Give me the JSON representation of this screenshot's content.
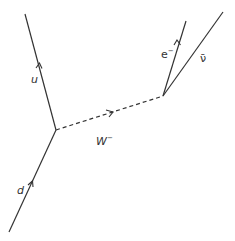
{
  "diagram": {
    "type": "feynman",
    "colors": {
      "line": "#333333",
      "background": "#ffffff"
    },
    "vertices": [
      {
        "id": "v1",
        "x": 56,
        "y": 130
      },
      {
        "id": "v2",
        "x": 163,
        "y": 96
      }
    ],
    "lines": [
      {
        "id": "d",
        "label": "d",
        "style": "solid",
        "from": [
          9,
          232
        ],
        "to": [
          56,
          130
        ],
        "arrow": "toward-vertex"
      },
      {
        "id": "u",
        "label": "u",
        "style": "solid",
        "from": [
          56,
          130
        ],
        "to": [
          25,
          14
        ],
        "arrow": "away-from-vertex"
      },
      {
        "id": "W",
        "label": "W⁻",
        "style": "dashed",
        "from": [
          56,
          130
        ],
        "to": [
          163,
          96
        ],
        "arrow": "forward"
      },
      {
        "id": "e",
        "label": "e⁻",
        "style": "solid",
        "from": [
          163,
          96
        ],
        "to": [
          186,
          21
        ],
        "arrow": "away-from-vertex"
      },
      {
        "id": "nubar",
        "label": "ν̄",
        "style": "solid",
        "from": [
          163,
          96
        ],
        "to": [
          223,
          12
        ],
        "arrow": "none"
      }
    ]
  },
  "labels": {
    "u": "u",
    "d": "d",
    "w_base": "W",
    "w_sup": "−",
    "e_base": "e",
    "e_sup": "−",
    "nubar": "ν̄"
  }
}
